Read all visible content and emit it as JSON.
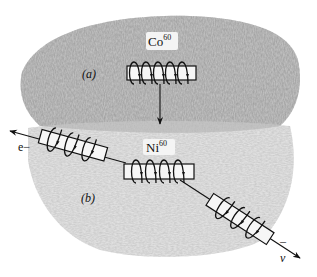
{
  "figure": {
    "labels": {
      "cobalt": "Co",
      "cobalt_mass": "60",
      "nickel": "Ni",
      "nickel_mass": "60",
      "panel_a": "(a)",
      "panel_b": "(b)",
      "electron": "e−",
      "antineutrino": "ν",
      "antineutrino_bar": "¯"
    },
    "colors": {
      "upper_region": "#7a7a7a",
      "lower_region": "#c4c4c4",
      "ink": "#111111"
    },
    "elements": {
      "co_coil_turns": 5,
      "ni_coil_turns": 4,
      "electron_coil_turns": 3,
      "antineutrino_coil_turns": 3
    }
  }
}
